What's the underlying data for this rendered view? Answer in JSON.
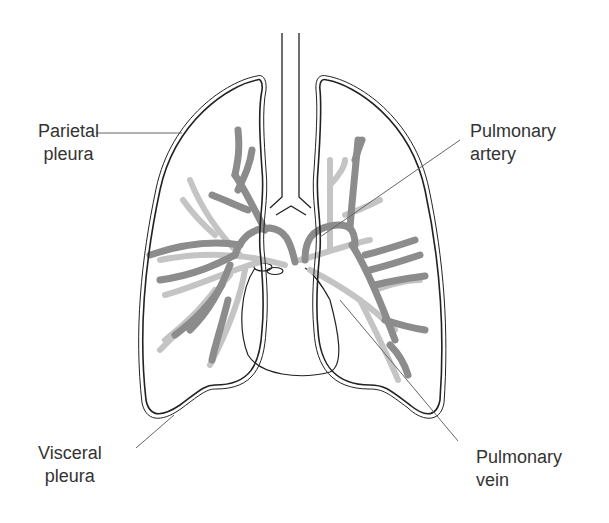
{
  "diagram": {
    "labels": {
      "parietal_pleura": {
        "line1": "Parietal",
        "line2": "pleura"
      },
      "pulmonary_artery": {
        "line1": "Pulmonary",
        "line2": "artery"
      },
      "visceral_pleura": {
        "line1": "Visceral",
        "line2": "pleura"
      },
      "pulmonary_vein": {
        "line1": "Pulmonary",
        "line2": "vein"
      }
    },
    "colors": {
      "outline": "#222222",
      "artery": "#8c8c8c",
      "vein": "#c4c4c4",
      "leader_line": "#666666",
      "text": "#333333"
    }
  }
}
